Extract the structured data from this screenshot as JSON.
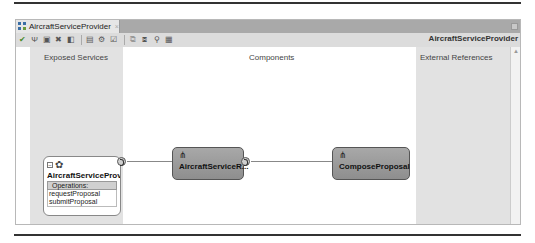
{
  "window": {
    "tab_label": "AircraftServiceProvider",
    "tab_icon": "composite-icon",
    "toolbar_title": "AircraftServiceProvider",
    "toolbar_icons": [
      "validate-icon",
      "wsdl-icon",
      "save-icon",
      "delete-icon",
      "deploy-icon",
      "test-icon",
      "settings-icon",
      "clipboard-icon",
      "copy-icon",
      "paste-icon",
      "find-icon",
      "layout-icon"
    ]
  },
  "columns": {
    "left": "Exposed Services",
    "middle": "Components",
    "right": "External References"
  },
  "service": {
    "name": "AircraftServiceProvi...",
    "operations_label": "Operations:",
    "operations": [
      "requestProposal",
      "submitProposal"
    ]
  },
  "components": [
    {
      "name": "AircraftServiceR..."
    },
    {
      "name": "ComposeProposal"
    }
  ],
  "colors": {
    "lane_bg": "#e2e2e2",
    "component_bg": "#9a9a9a",
    "tabbar_bg": "#a9a9a9"
  }
}
